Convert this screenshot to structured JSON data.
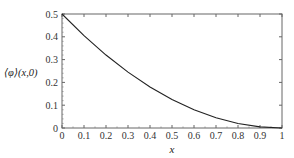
{
  "chart_data": {
    "type": "line",
    "title": "",
    "xlabel": "x",
    "ylabel": "⟨φ⟩(x,0)",
    "xlim": [
      0,
      1
    ],
    "ylim": [
      0,
      0.5
    ],
    "grid": false,
    "legend": null,
    "x_ticks": [
      "0",
      "0.1",
      "0.2",
      "0.3",
      "0.4",
      "0.5",
      "0.6",
      "0.7",
      "0.8",
      "0.9",
      "1"
    ],
    "y_ticks": [
      "0",
      "0.1",
      "0.2",
      "0.3",
      "0.4",
      "0.5"
    ],
    "series": [
      {
        "name": "⟨φ⟩(x,0)",
        "color": "#222222",
        "x": [
          0,
          0.1,
          0.2,
          0.3,
          0.4,
          0.5,
          0.6,
          0.7,
          0.8,
          0.9,
          1.0
        ],
        "values": [
          0.5,
          0.405,
          0.32,
          0.245,
          0.18,
          0.125,
          0.08,
          0.045,
          0.02,
          0.005,
          0.0
        ]
      }
    ]
  }
}
